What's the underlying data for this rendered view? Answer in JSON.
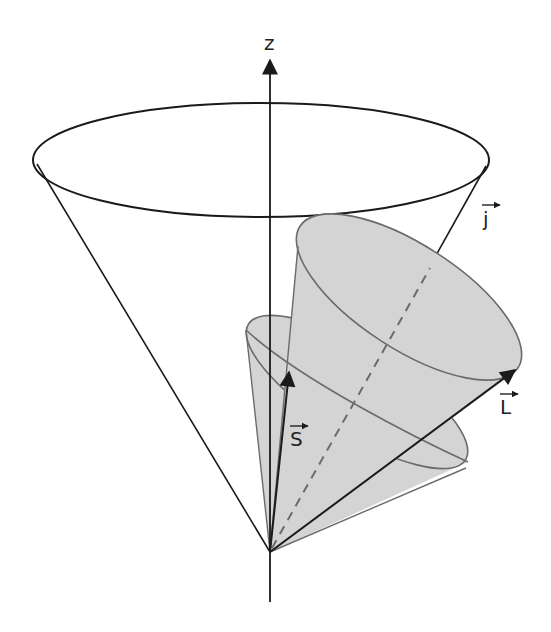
{
  "figure": {
    "labels": {
      "z_axis": "z",
      "j_vector": "j",
      "l_vector": "L",
      "s_vector": "S"
    },
    "colors": {
      "line": "#1a1a1a",
      "cone_fill": "#d4d4d4",
      "cone_edge": "#6b6b6b",
      "background": "#ffffff"
    }
  }
}
